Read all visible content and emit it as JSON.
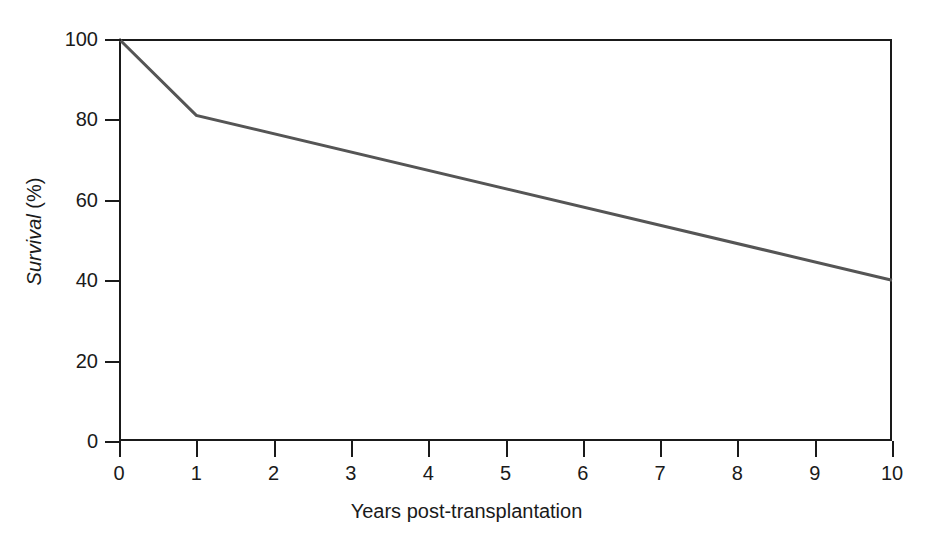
{
  "chart_data": {
    "type": "line",
    "title": "",
    "subtitle": "",
    "xlabel": "Years post-transplantation",
    "ylabel_italic_part": "Survival",
    "ylabel_roman_part": "(%)",
    "ylabel": "Survival (%)",
    "xlim": [
      0,
      10
    ],
    "ylim": [
      0,
      100
    ],
    "xticks": [
      0,
      1,
      2,
      3,
      4,
      5,
      6,
      7,
      8,
      9,
      10
    ],
    "xtick_labels": [
      "0",
      "1",
      "2",
      "3",
      "4",
      "5",
      "6",
      "7",
      "8",
      "9",
      "10"
    ],
    "yticks": [
      0,
      20,
      40,
      60,
      80,
      100
    ],
    "ytick_labels": [
      "0",
      "20",
      "40",
      "60",
      "80",
      "100"
    ],
    "grid": false,
    "legend": false,
    "legend_position": "none",
    "series": [
      {
        "name": "Survival",
        "color": "#555555",
        "x": [
          0,
          1,
          10
        ],
        "values": [
          100,
          81,
          40
        ],
        "points": [
          {
            "x": 0,
            "y": 100
          },
          {
            "x": 1,
            "y": 81
          },
          {
            "x": 10,
            "y": 40
          }
        ]
      }
    ],
    "annotations": []
  },
  "figure": {
    "background_color": "#ffffff",
    "axis_color": "#1a1a1a",
    "line_color": "#555555"
  }
}
